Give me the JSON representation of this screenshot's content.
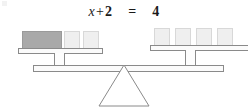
{
  "diagram": {
    "equation": {
      "left_variable": "x",
      "plus_operator": "+",
      "left_constant": "2",
      "equals_operator": "=",
      "right_constant": "4",
      "full_text": "x + 2 = 4"
    },
    "colors": {
      "variable_block": "#a9a9a9",
      "unit_block": "#efefef",
      "outline": "#8a8a8a",
      "background": "#ffffff",
      "text": "#1a1a1a"
    },
    "left_pan": {
      "label": "left-pan",
      "state": "down",
      "blocks": [
        {
          "kind": "variable",
          "label": "x",
          "left": 22,
          "top": 31,
          "width": 40,
          "height": 19
        },
        {
          "kind": "unit",
          "label": "1",
          "left": 64,
          "top": 31,
          "width": 16,
          "height": 19
        },
        {
          "kind": "unit",
          "label": "1",
          "left": 83,
          "top": 31,
          "width": 16,
          "height": 19
        }
      ],
      "plate": {
        "left": 18,
        "top": 48,
        "width": 85,
        "height": 6
      },
      "hanger": {
        "left": 54,
        "top": 54,
        "width": 11,
        "height": 12
      }
    },
    "right_pan": {
      "label": "right-pan",
      "state": "up",
      "blocks": [
        {
          "kind": "unit",
          "label": "1",
          "left": 154,
          "top": 28,
          "width": 16,
          "height": 19
        },
        {
          "kind": "unit",
          "label": "1",
          "left": 175,
          "top": 28,
          "width": 16,
          "height": 19
        },
        {
          "kind": "unit",
          "label": "1",
          "left": 196,
          "top": 28,
          "width": 16,
          "height": 19
        },
        {
          "kind": "unit",
          "label": "1",
          "left": 217,
          "top": 28,
          "width": 16,
          "height": 19
        }
      ],
      "plate": {
        "left": 150,
        "top": 45,
        "width": 98,
        "height": 6
      },
      "hanger": {
        "left": 185,
        "top": 51,
        "width": 11,
        "height": 12
      }
    },
    "beam": {
      "left": 33,
      "top": 65,
      "width": 191,
      "height": 7
    },
    "fulcrum": {
      "apex_x": 124,
      "apex_y": 64,
      "base_left": 99,
      "base_right": 149,
      "base_y": 106
    }
  }
}
